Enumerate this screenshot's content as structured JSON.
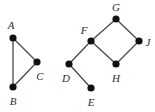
{
  "figure": {
    "background_color": "#ffffff",
    "edge_color": "#4a4a4a",
    "vertex_color": "#111111",
    "label_color": "#2b2b2b",
    "vertex_radius": 3.6,
    "edge_width": 1.3,
    "width": 155,
    "height": 112
  },
  "graphs": [
    {
      "name": "left-graph",
      "vertices": [
        {
          "id": "A",
          "label": "A",
          "x": 13,
          "y": 38,
          "label_x": 11,
          "label_y": 25
        },
        {
          "id": "B",
          "label": "B",
          "x": 13,
          "y": 87,
          "label_x": 13,
          "label_y": 101
        },
        {
          "id": "C",
          "label": "C",
          "x": 37,
          "y": 62,
          "label_x": 40,
          "label_y": 76
        }
      ],
      "edges": [
        {
          "from": "A",
          "to": "B",
          "x1": 13,
          "y1": 38,
          "x2": 13,
          "y2": 87
        },
        {
          "from": "A",
          "to": "C",
          "x1": 13,
          "y1": 38,
          "x2": 37,
          "y2": 62
        },
        {
          "from": "B",
          "to": "C",
          "x1": 13,
          "y1": 87,
          "x2": 37,
          "y2": 62
        }
      ]
    },
    {
      "name": "right-graph",
      "vertices": [
        {
          "id": "D",
          "label": "D",
          "x": 69,
          "y": 64,
          "label_x": 66,
          "label_y": 78
        },
        {
          "id": "E",
          "label": "E",
          "x": 91,
          "y": 88,
          "label_x": 91,
          "label_y": 102
        },
        {
          "id": "F",
          "label": "F",
          "x": 91,
          "y": 41,
          "label_x": 84,
          "label_y": 30
        },
        {
          "id": "G",
          "label": "G",
          "x": 116,
          "y": 19,
          "label_x": 116,
          "label_y": 7
        },
        {
          "id": "H",
          "label": "H",
          "x": 116,
          "y": 64,
          "label_x": 116,
          "label_y": 78
        },
        {
          "id": "J",
          "label": "J",
          "x": 139,
          "y": 41,
          "label_x": 148,
          "label_y": 42
        }
      ],
      "edges": [
        {
          "from": "D",
          "to": "E",
          "x1": 69,
          "y1": 64,
          "x2": 91,
          "y2": 88
        },
        {
          "from": "D",
          "to": "F",
          "x1": 69,
          "y1": 64,
          "x2": 91,
          "y2": 41
        },
        {
          "from": "F",
          "to": "G",
          "x1": 91,
          "y1": 41,
          "x2": 116,
          "y2": 19
        },
        {
          "from": "F",
          "to": "H",
          "x1": 91,
          "y1": 41,
          "x2": 116,
          "y2": 64
        },
        {
          "from": "G",
          "to": "J",
          "x1": 116,
          "y1": 19,
          "x2": 139,
          "y2": 41
        },
        {
          "from": "H",
          "to": "J",
          "x1": 116,
          "y1": 64,
          "x2": 139,
          "y2": 41
        }
      ]
    }
  ]
}
